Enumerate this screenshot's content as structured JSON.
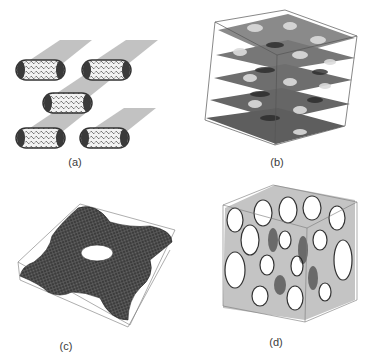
{
  "figure": {
    "panels": [
      {
        "id": "a",
        "label": "(a)",
        "description": "hexagonally packed cylindrical micelles with shadows"
      },
      {
        "id": "b",
        "label": "(b)",
        "description": "layered perforated lamellar structure in cube"
      },
      {
        "id": "c",
        "label": "(c)",
        "description": "periodic mesh surface in rectangular box"
      },
      {
        "id": "d",
        "label": "(d)",
        "description": "bicontinuous porous network in cube"
      }
    ]
  },
  "colors": {
    "background": "#ffffff",
    "shadow": "#b4b4b4",
    "dark": "#2e2e2e",
    "mid": "#6a6a6a",
    "light": "#d8d8d8",
    "label": "#3a3a3a"
  }
}
